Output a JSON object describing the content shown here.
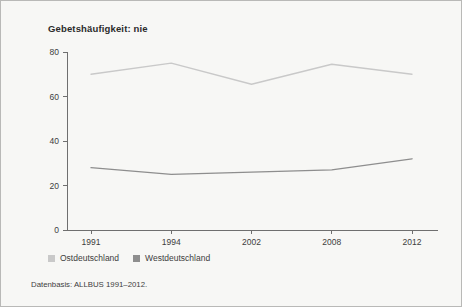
{
  "figure": {
    "background_color": "#f7f7f5",
    "border_color": "#b9b9b7",
    "footnote": "Datenbasis: ALLBUS 1991–2012."
  },
  "legend": {
    "position": "bottom-left",
    "entries": [
      {
        "label": "Ostdeutschland",
        "color": "#c9c9c9",
        "swatch": "square-swatch"
      },
      {
        "label": "Westdeutschland",
        "color": "#8e8e8e",
        "swatch": "square-swatch"
      }
    ]
  },
  "chart_data": {
    "type": "line",
    "title": "Gebetshäufigkeit: nie",
    "xlabel": "",
    "ylabel": "",
    "categories": [
      "1991",
      "1994",
      "2002",
      "2008",
      "2012"
    ],
    "x": [
      1991,
      1994,
      2002,
      2008,
      2012
    ],
    "ylim": [
      0,
      80
    ],
    "yticks": [
      0,
      20,
      40,
      60,
      80
    ],
    "ytick_labels": [
      "0",
      "20",
      "40",
      "60",
      "80"
    ],
    "xtick_labels": [
      "1991",
      "1994",
      "2002",
      "2008",
      "2012"
    ],
    "grid": false,
    "legend_position": "bottom-left",
    "series": [
      {
        "name": "Ostdeutschland",
        "color": "#c9c9c9",
        "values": [
          70,
          75,
          65.5,
          74.5,
          70
        ]
      },
      {
        "name": "Westdeutschland",
        "color": "#8e8e8e",
        "values": [
          28,
          25,
          26,
          27,
          32
        ]
      }
    ]
  }
}
